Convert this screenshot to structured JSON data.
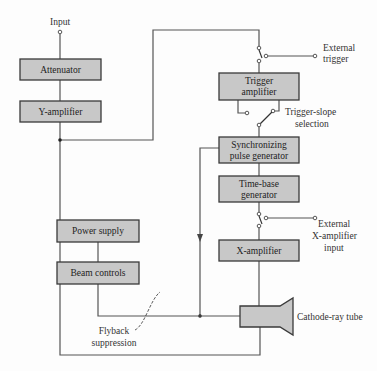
{
  "diagram": {
    "blocks": {
      "attenuator": "Attenuator",
      "y_amplifier": "Y-amplifier",
      "trigger_amplifier_l1": "Trigger",
      "trigger_amplifier_l2": "amplifier",
      "sync_l1": "Synchronizing",
      "sync_l2": "pulse generator",
      "timebase_l1": "Time-base",
      "timebase_l2": "generator",
      "x_amplifier": "X-amplifier",
      "power_supply": "Power supply",
      "beam_controls": "Beam controls"
    },
    "labels": {
      "input": "Input",
      "external_trigger_l1": "External",
      "external_trigger_l2": "trigger",
      "trigger_slope_l1": "Trigger-slope",
      "trigger_slope_l2": "selection",
      "external_x_l1": "External",
      "external_x_l2": "X-amplifier",
      "external_x_l3": "input",
      "flyback_l1": "Flyback",
      "flyback_l2": "suppression",
      "crt": "Cathode-ray tube"
    },
    "colors": {
      "block_fill": "#c8c8c8",
      "block_stroke": "#3a3a3a",
      "wire": "#555555"
    }
  }
}
